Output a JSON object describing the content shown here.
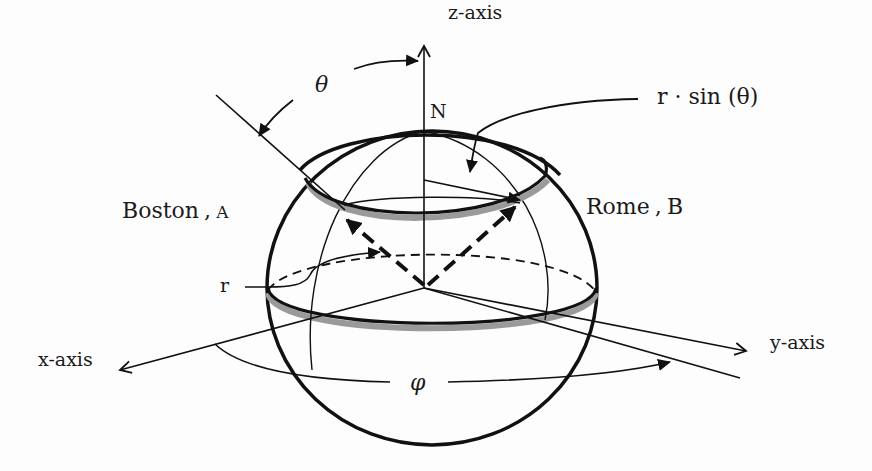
{
  "diagram": {
    "type": "spherical-coordinates",
    "labels": {
      "z_axis": "z-axis",
      "x_axis": "x-axis",
      "y_axis": "y-axis",
      "north": "N",
      "theta": "θ",
      "phi": "φ",
      "radius": "r",
      "small_circle_radius": "r · sin (θ)",
      "point_a_name": "Boston",
      "point_a_sep": ",",
      "point_a_letter": "A",
      "point_b_name": "Rome",
      "point_b_sep": ",",
      "point_b_letter": "B"
    },
    "colors": {
      "ink": "#111111",
      "shadow": "#9a9a9a",
      "background": "#fdfdfd"
    }
  }
}
